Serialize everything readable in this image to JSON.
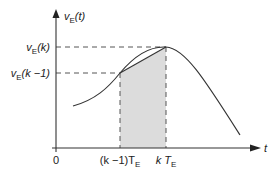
{
  "diagram": {
    "type": "signal-sampling",
    "y_axis_label": {
      "main": "v",
      "sub": "E",
      "arg": "(t)"
    },
    "x_axis_label": "t",
    "origin_label": "0",
    "level_high": {
      "main": "v",
      "sub": "E",
      "arg": "(k)"
    },
    "level_low": {
      "main": "v",
      "sub": "E",
      "arg": "(k −1)"
    },
    "tick_prev": {
      "prefix": "(k −1)T",
      "sub": "E"
    },
    "tick_curr": {
      "prefix": "k T",
      "sub": "E"
    },
    "colors": {
      "line": "#333333",
      "shade": "#dcdcdc",
      "dash": "#555555"
    }
  }
}
